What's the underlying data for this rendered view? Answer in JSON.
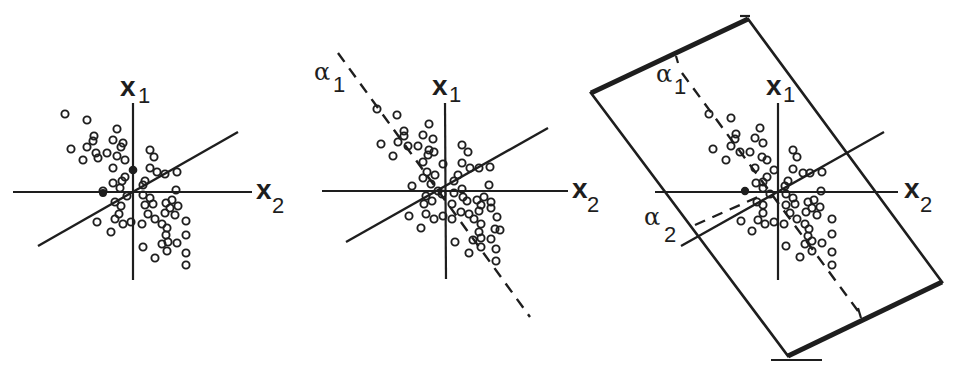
{
  "figure": {
    "panels": [
      {
        "id": "panel-1",
        "description": "Scatter of data points with x1/x2 axes and a solid oblique line",
        "axis_labels": {
          "x1_main": "x",
          "x1_sub": "1",
          "x2_main": "x",
          "x2_sub": "2"
        }
      },
      {
        "id": "panel-2",
        "description": "Same scatter with dashed alpha-1 direction",
        "axis_labels": {
          "x1_main": "x",
          "x1_sub": "1",
          "x2_main": "x",
          "x2_sub": "2"
        },
        "direction_labels": {
          "a1_main": "α",
          "a1_sub": "1"
        }
      },
      {
        "id": "panel-3",
        "description": "Same scatter with dashed alpha-1 and alpha-2 directions inside a rotated bounding rectangle",
        "axis_labels": {
          "x1_main": "x",
          "x1_sub": "1",
          "x2_main": "x",
          "x2_sub": "2"
        },
        "direction_labels": {
          "a1_main": "α",
          "a1_sub": "1",
          "a2_main": "α",
          "a2_sub": "2"
        }
      }
    ],
    "colors": {
      "ink": "#1e1e1e",
      "background": "#ffffff"
    }
  }
}
